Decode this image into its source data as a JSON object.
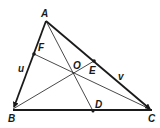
{
  "figure": {
    "type": "triangle-medians",
    "colors": {
      "background": "#ffffff",
      "stroke": "#1a1a1a"
    },
    "vertices": {
      "A": {
        "label": "A",
        "x": 46,
        "y": 21
      },
      "B": {
        "label": "B",
        "x": 13,
        "y": 109
      },
      "C": {
        "label": "C",
        "x": 152,
        "y": 110
      }
    },
    "points": {
      "F": {
        "label": "F",
        "x": 34,
        "y": 54
      },
      "E": {
        "label": "E",
        "x": 94,
        "y": 61
      },
      "D": {
        "label": "D",
        "x": 93,
        "y": 111
      },
      "O": {
        "label": "O",
        "x": 73,
        "y": 74
      }
    },
    "vectors": {
      "u": {
        "label": "u"
      },
      "v": {
        "label": "v"
      }
    }
  }
}
